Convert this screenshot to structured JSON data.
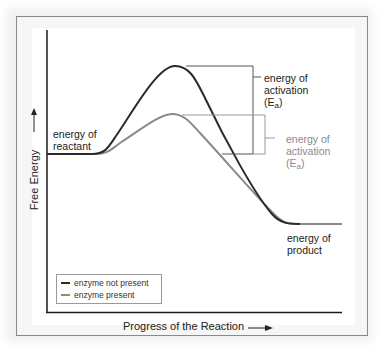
{
  "diagram": {
    "type": "energy-profile",
    "y_axis_label": "Free Energy",
    "x_axis_label": "Progress of the Reaction",
    "labels": {
      "reactant": [
        "energy of",
        "reactant"
      ],
      "product": [
        "energy of",
        "product"
      ],
      "activation_dark": [
        "energy of",
        "activation",
        "(E",
        "a",
        ")"
      ],
      "activation_light": [
        "energy of",
        "activation",
        "(E",
        "a",
        ")"
      ]
    },
    "legend": [
      {
        "label": "enzyme not present",
        "color": "#2b2b2b"
      },
      {
        "label": "enzyme present",
        "color": "#8a8a8a"
      }
    ],
    "colors": {
      "dark_curve": "#2b2b2b",
      "light_curve": "#8a8a8a",
      "axis": "#1a1a1a",
      "frame": "#8a8a8a"
    }
  }
}
